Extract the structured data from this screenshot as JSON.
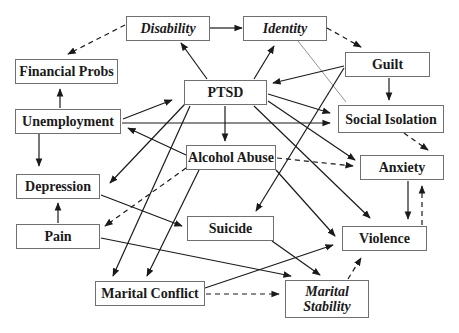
{
  "diagram": {
    "nodes": [
      {
        "id": "disability",
        "label": "Disability",
        "italic": true,
        "x": 126,
        "y": 16,
        "w": 84,
        "h": 25
      },
      {
        "id": "identity",
        "label": "Identity",
        "italic": true,
        "x": 243,
        "y": 16,
        "w": 84,
        "h": 25
      },
      {
        "id": "financial",
        "label": "Financial Probs",
        "italic": false,
        "x": 15,
        "y": 59,
        "w": 103,
        "h": 25
      },
      {
        "id": "guilt",
        "label": "Guilt",
        "italic": false,
        "x": 345,
        "y": 52,
        "w": 85,
        "h": 25
      },
      {
        "id": "ptsd",
        "label": "PTSD",
        "italic": false,
        "x": 184,
        "y": 80,
        "w": 83,
        "h": 25
      },
      {
        "id": "unemployment",
        "label": "Unemployment",
        "italic": false,
        "x": 15,
        "y": 109,
        "w": 106,
        "h": 25
      },
      {
        "id": "social",
        "label": "Social Isolation",
        "italic": false,
        "x": 338,
        "y": 105,
        "w": 106,
        "h": 28
      },
      {
        "id": "alcohol",
        "label": "Alcohol Abuse",
        "italic": false,
        "x": 186,
        "y": 145,
        "w": 90,
        "h": 25
      },
      {
        "id": "depression",
        "label": "Depression",
        "italic": false,
        "x": 16,
        "y": 174,
        "w": 84,
        "h": 25
      },
      {
        "id": "anxiety",
        "label": "Anxiety",
        "italic": false,
        "x": 360,
        "y": 155,
        "w": 84,
        "h": 25
      },
      {
        "id": "pain",
        "label": "Pain",
        "italic": false,
        "x": 16,
        "y": 224,
        "w": 84,
        "h": 25
      },
      {
        "id": "suicide",
        "label": "Suicide",
        "italic": false,
        "x": 187,
        "y": 216,
        "w": 87,
        "h": 25
      },
      {
        "id": "violence",
        "label": "Violence",
        "italic": false,
        "x": 342,
        "y": 226,
        "w": 85,
        "h": 25
      },
      {
        "id": "marital_conflict",
        "label": "Marital Conflict",
        "italic": false,
        "x": 95,
        "y": 281,
        "w": 110,
        "h": 25
      },
      {
        "id": "marital_stability",
        "label": "Marital\nStability",
        "italic": true,
        "x": 285,
        "y": 280,
        "w": 84,
        "h": 38
      }
    ],
    "edges": [
      {
        "from": "disability",
        "to": "identity",
        "style": "solid",
        "x1": 210,
        "y1": 28,
        "x2": 242,
        "y2": 28
      },
      {
        "from": "disability",
        "to": "financial",
        "style": "dashed",
        "x1": 125,
        "y1": 25,
        "x2": 68,
        "y2": 54
      },
      {
        "from": "identity",
        "to": "guilt",
        "style": "dashed",
        "x1": 327,
        "y1": 28,
        "x2": 361,
        "y2": 47
      },
      {
        "from": "identity",
        "to": "social",
        "style": "thin",
        "x1": 298,
        "y1": 41,
        "x2": 346,
        "y2": 102,
        "noarrow": true
      },
      {
        "from": "ptsd",
        "to": "disability",
        "style": "solid",
        "x1": 207,
        "y1": 79,
        "x2": 181,
        "y2": 43
      },
      {
        "from": "ptsd",
        "to": "identity",
        "style": "solid",
        "x1": 254,
        "y1": 79,
        "x2": 274,
        "y2": 46
      },
      {
        "from": "guilt",
        "to": "ptsd",
        "style": "solid",
        "x1": 344,
        "y1": 66,
        "x2": 273,
        "y2": 83
      },
      {
        "from": "guilt",
        "to": "social",
        "style": "solid",
        "x1": 389,
        "y1": 78,
        "x2": 389,
        "y2": 100
      },
      {
        "from": "guilt",
        "to": "suicide",
        "style": "solid",
        "x1": 344,
        "y1": 68,
        "x2": 256,
        "y2": 211
      },
      {
        "from": "unemployment",
        "to": "financial",
        "style": "solid",
        "x1": 60,
        "y1": 108,
        "x2": 60,
        "y2": 89
      },
      {
        "from": "unemployment",
        "to": "ptsd",
        "style": "solid",
        "x1": 123,
        "y1": 119,
        "x2": 172,
        "y2": 100
      },
      {
        "from": "unemployment",
        "to": "social",
        "style": "solid",
        "x1": 122,
        "y1": 123,
        "x2": 330,
        "y2": 123
      },
      {
        "from": "unemployment",
        "to": "depression",
        "style": "solid",
        "x1": 39,
        "y1": 134,
        "x2": 39,
        "y2": 166
      },
      {
        "from": "alcohol",
        "to": "unemployment",
        "style": "solid",
        "x1": 186,
        "y1": 155,
        "x2": 128,
        "y2": 128
      },
      {
        "from": "ptsd",
        "to": "social",
        "style": "solid",
        "x1": 268,
        "y1": 94,
        "x2": 330,
        "y2": 113
      },
      {
        "from": "ptsd",
        "to": "alcohol",
        "style": "solid",
        "x1": 225,
        "y1": 106,
        "x2": 225,
        "y2": 141
      },
      {
        "from": "ptsd",
        "to": "anxiety",
        "style": "solid",
        "x1": 268,
        "y1": 101,
        "x2": 355,
        "y2": 160
      },
      {
        "from": "ptsd",
        "to": "violence",
        "style": "solid",
        "x1": 254,
        "y1": 106,
        "x2": 370,
        "y2": 218
      },
      {
        "from": "ptsd",
        "to": "depression",
        "style": "solid",
        "x1": 185,
        "y1": 104,
        "x2": 110,
        "y2": 183
      },
      {
        "from": "ptsd",
        "to": "marital_conflict",
        "style": "solid",
        "x1": 190,
        "y1": 106,
        "x2": 113,
        "y2": 276
      },
      {
        "from": "social",
        "to": "anxiety",
        "style": "dashed",
        "x1": 404,
        "y1": 133,
        "x2": 428,
        "y2": 150
      },
      {
        "from": "alcohol",
        "to": "anxiety",
        "style": "dashed",
        "x1": 277,
        "y1": 158,
        "x2": 353,
        "y2": 166
      },
      {
        "from": "alcohol",
        "to": "pain",
        "style": "dashed",
        "x1": 186,
        "y1": 168,
        "x2": 105,
        "y2": 226
      },
      {
        "from": "alcohol",
        "to": "marital_conflict",
        "style": "solid",
        "x1": 199,
        "y1": 170,
        "x2": 147,
        "y2": 276
      },
      {
        "from": "alcohol",
        "to": "violence",
        "style": "solid",
        "x1": 276,
        "y1": 170,
        "x2": 335,
        "y2": 236
      },
      {
        "from": "anxiety",
        "to": "violence",
        "style": "solid",
        "x1": 408,
        "y1": 181,
        "x2": 408,
        "y2": 219
      },
      {
        "from": "violence",
        "to": "anxiety",
        "style": "dashed",
        "x1": 422,
        "y1": 225,
        "x2": 422,
        "y2": 186
      },
      {
        "from": "pain",
        "to": "depression",
        "style": "solid",
        "x1": 58,
        "y1": 223,
        "x2": 58,
        "y2": 203
      },
      {
        "from": "depression",
        "to": "suicide",
        "style": "solid",
        "x1": 101,
        "y1": 195,
        "x2": 182,
        "y2": 226
      },
      {
        "from": "pain",
        "to": "marital_stability",
        "style": "solid",
        "x1": 101,
        "y1": 238,
        "x2": 291,
        "y2": 276
      },
      {
        "from": "suicide",
        "to": "marital_stability",
        "style": "solid",
        "x1": 272,
        "y1": 241,
        "x2": 320,
        "y2": 275
      },
      {
        "from": "marital_conflict",
        "to": "violence",
        "style": "solid",
        "x1": 205,
        "y1": 288,
        "x2": 333,
        "y2": 245
      },
      {
        "from": "marital_conflict",
        "to": "marital_stability",
        "style": "dashed",
        "x1": 206,
        "y1": 294,
        "x2": 279,
        "y2": 294
      },
      {
        "from": "marital_stability",
        "to": "violence",
        "style": "dashed",
        "x1": 348,
        "y1": 279,
        "x2": 361,
        "y2": 258
      }
    ]
  }
}
